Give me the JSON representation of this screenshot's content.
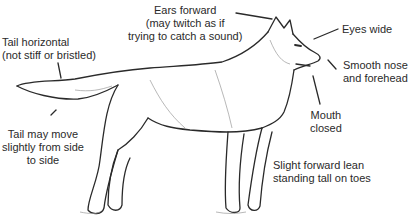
{
  "diagram": {
    "labels": {
      "ears": {
        "lines": [
          "Ears forward",
          "(may twitch as if",
          "trying to catch a sound)"
        ]
      },
      "eyes": {
        "lines": [
          "Eyes wide"
        ]
      },
      "nose": {
        "lines": [
          "Smooth nose",
          "and forehead"
        ]
      },
      "mouth": {
        "lines": [
          "Mouth",
          "closed"
        ]
      },
      "lean": {
        "lines": [
          "Slight forward lean",
          "standing tall on toes"
        ]
      },
      "tail": {
        "lines": [
          "Tail horizontal",
          "(not stiff or bristled)"
        ]
      },
      "tail_move": {
        "lines": [
          "Tail may move",
          "slightly from side",
          "to side"
        ]
      }
    },
    "colors": {
      "ink": "#2a2a2a",
      "background": "#ffffff",
      "shading": "#9a9a9a"
    }
  }
}
